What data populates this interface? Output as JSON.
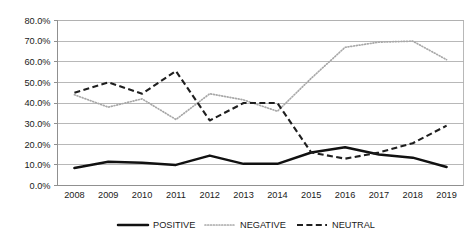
{
  "chart_data": {
    "type": "line",
    "title": "",
    "subtitle": "",
    "xlabel": "",
    "ylabel": "",
    "categories": [
      "2008",
      "2009",
      "2010",
      "2011",
      "2012",
      "2013",
      "2014",
      "2015",
      "2016",
      "2017",
      "2018",
      "2019"
    ],
    "ylim": [
      0,
      80
    ],
    "ytick_labels": [
      "0.0%",
      "10.0%",
      "20.0%",
      "30.0%",
      "40.0%",
      "50.0%",
      "60.0%",
      "70.0%",
      "80.0%"
    ],
    "ytick_values": [
      0,
      10,
      20,
      30,
      40,
      50,
      60,
      70,
      80
    ],
    "grid": "horizontal",
    "legend_position": "bottom",
    "series": [
      {
        "name": "POSITIVE",
        "style": "solid",
        "color": "#111111",
        "values": [
          8.5,
          11.5,
          11.0,
          10.0,
          14.5,
          10.5,
          10.5,
          16.0,
          18.5,
          15.0,
          13.5,
          9.0
        ]
      },
      {
        "name": "NEGATIVE",
        "style": "dotted",
        "color": "#a8a8a8",
        "values": [
          44.0,
          38.0,
          42.0,
          32.0,
          44.5,
          41.5,
          36.0,
          52.0,
          67.0,
          69.5,
          70.0,
          61.0
        ]
      },
      {
        "name": "NEUTRAL",
        "style": "dashed",
        "color": "#1f1f1f",
        "values": [
          45.0,
          50.0,
          44.5,
          55.5,
          31.5,
          40.0,
          40.0,
          16.0,
          13.0,
          16.0,
          20.5,
          29.0
        ]
      }
    ]
  },
  "legend": {
    "items": [
      {
        "label": "POSITIVE"
      },
      {
        "label": "NEGATIVE"
      },
      {
        "label": "NEUTRAL"
      }
    ]
  }
}
